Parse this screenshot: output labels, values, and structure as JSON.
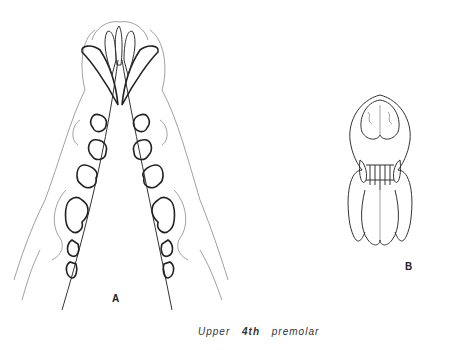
{
  "figure": {
    "title": "Upper 4th premolar",
    "caption_parts": [
      "Upper",
      "4th",
      "premolar"
    ],
    "panels": [
      {
        "id": "A",
        "label": "A",
        "description": "ventral view of upper jaw / palate showing dentition"
      },
      {
        "id": "B",
        "label": "B",
        "description": "frontal view of skull showing incisors and canines"
      }
    ]
  }
}
